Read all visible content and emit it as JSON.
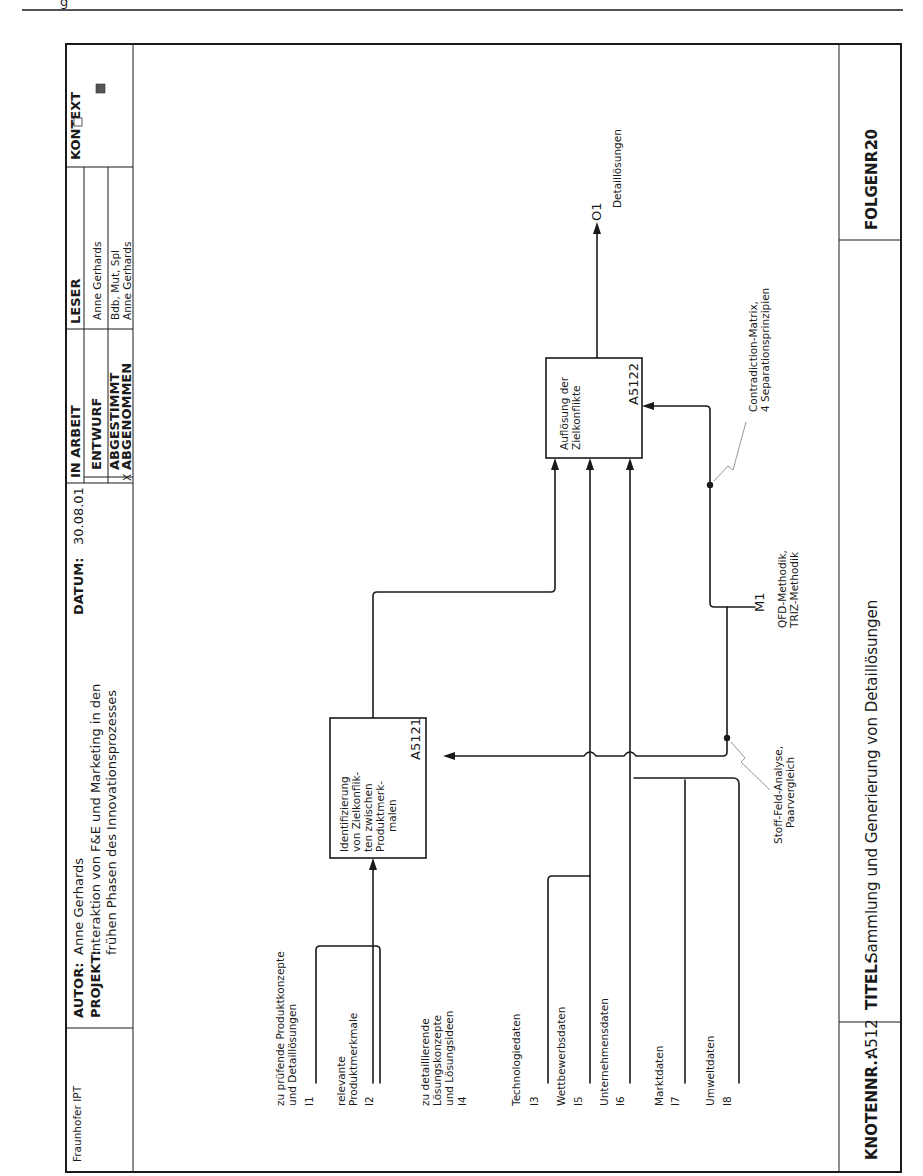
{
  "page_header": {
    "running_head": "g"
  },
  "title_block": {
    "organization": "Fraunhofer IPT",
    "author_label": "AUTOR:",
    "author_value": "Anne Gerhards",
    "date_label": "DATUM:",
    "date_value": "30.08.01",
    "project_label": "PROJEKT:",
    "project_line1": "Interaktion von F&E und Marketing in den",
    "project_line2": "frühen Phasen des Innovationsprozesses",
    "status_header": "IN ARBEIT",
    "reader_header": "LESER",
    "context_header": "KONTEXT",
    "status_rows": [
      {
        "mark": "",
        "label": "ENTWURF",
        "reader": "Anne Gerhards"
      },
      {
        "mark": "",
        "label": "ABGESTIMMT",
        "reader": "Bdb, Mut, Spl"
      },
      {
        "mark": "X",
        "label": "ABGENOMMEN",
        "reader": "Anne Gerhards"
      }
    ]
  },
  "footer": {
    "node_label": "KNOTENNR.:",
    "node_value": "A512",
    "title_label": "TITEL:",
    "title_value": "Sammlung und Generierung von Detaillösungen",
    "sequence_label": "FOLGENR.:",
    "sequence_value": "20"
  },
  "diagram": {
    "activities": [
      {
        "id": "A5121",
        "lines": [
          "Identifizierung",
          "von Zielkonflik-",
          "ten zwischen",
          "Produktmerk-",
          "malen"
        ]
      },
      {
        "id": "A5122",
        "lines": [
          "Auflösung der",
          "Zielkonflikte"
        ]
      }
    ],
    "inputs": [
      {
        "code": "I1",
        "lines": [
          "zu prüfende Produktkonzepte",
          "und Detaillösungen"
        ]
      },
      {
        "code": "I2",
        "lines": [
          "relevante",
          "Produktmerkmale"
        ]
      },
      {
        "code": "I4",
        "lines": [
          "zu detaillierende",
          "Lösungskonzepte",
          "und Lösungsideen"
        ]
      },
      {
        "code": "I3",
        "lines": [
          "Technologiedaten"
        ]
      },
      {
        "code": "I5",
        "lines": [
          "Wettbewerbsdaten"
        ]
      },
      {
        "code": "I6",
        "lines": [
          "Unternehmensdaten"
        ]
      },
      {
        "code": "I7",
        "lines": [
          "Marktdaten"
        ]
      },
      {
        "code": "I8",
        "lines": [
          "Umweltdaten"
        ]
      }
    ],
    "controls": [
      {
        "code": "M1",
        "lines": [
          "QFD-Methodik,",
          "TRIZ-Methodik"
        ]
      }
    ],
    "control_annotations": [
      {
        "lines": [
          "Stoff-Feld-Analyse,",
          "Paarvergleich"
        ]
      },
      {
        "lines": [
          "Contradiction-Matrix,",
          "4 Separationsprinzipien"
        ]
      }
    ],
    "outputs": [
      {
        "code": "O1",
        "lines": [
          "Detaillösungen"
        ]
      }
    ]
  }
}
